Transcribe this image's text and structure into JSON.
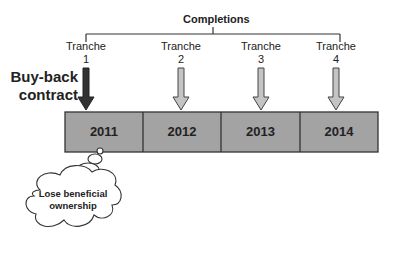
{
  "diagram": {
    "bracket_label": "Completions",
    "buyback_label_line1": "Buy-back",
    "buyback_label_line2": "contract",
    "tranches": [
      {
        "label": "Tranche",
        "number": "1",
        "arrow_style": "dark"
      },
      {
        "label": "Tranche",
        "number": "2",
        "arrow_style": "light"
      },
      {
        "label": "Tranche",
        "number": "3",
        "arrow_style": "light"
      },
      {
        "label": "Tranche",
        "number": "4",
        "arrow_style": "light"
      }
    ],
    "years": [
      "2011",
      "2012",
      "2013",
      "2014"
    ],
    "thought_cloud_line1": "Lose beneficial",
    "thought_cloud_line2": "ownership",
    "colors": {
      "box_fill": "#a3a3a3",
      "dark_arrow": "#333333",
      "light_arrow": "#bdbdbd",
      "line": "#333333"
    }
  }
}
